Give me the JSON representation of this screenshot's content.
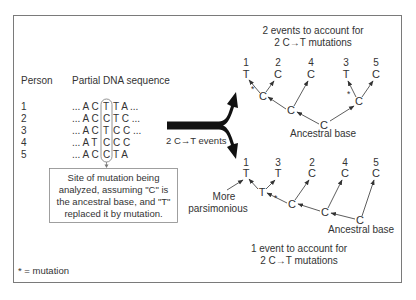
{
  "left_panel": {
    "header_person": "Person",
    "header_sequence": "Partial DNA sequence",
    "rows": [
      {
        "person": "1",
        "prefix": "... A C",
        "site": "T",
        "suffix": "T A ..."
      },
      {
        "person": "2",
        "prefix": "... A C",
        "site": "C",
        "suffix": "T C ..."
      },
      {
        "person": "3",
        "prefix": "... A C",
        "site": "T",
        "suffix": "C C ..."
      },
      {
        "person": "4",
        "prefix": "... A T",
        "site": "C",
        "suffix": "C C"
      },
      {
        "person": "5",
        "prefix": "... A C",
        "site": "C",
        "suffix": "T A"
      }
    ],
    "callout": {
      "line1": "Site of mutation being",
      "line2": "analyzed, assuming \"C\" is",
      "line3": "the ancestral base, and \"T\"",
      "line4": "replaced it by mutation."
    },
    "footnote": "* = mutation"
  },
  "split_arrow": {
    "label": "2 C→T events"
  },
  "top_tree": {
    "title_line1": "2 events to account for",
    "title_line2": "2 C→T mutations",
    "leaves": [
      {
        "num": "1",
        "base": "T"
      },
      {
        "num": "2",
        "base": "C"
      },
      {
        "num": "4",
        "base": "C"
      },
      {
        "num": "3",
        "base": "T"
      },
      {
        "num": "5",
        "base": "C"
      }
    ],
    "internal": [
      "C",
      "C",
      "C",
      "C"
    ],
    "mutation_mark": "*",
    "root_label": "Ancestral base"
  },
  "bottom_tree": {
    "leaves": [
      {
        "num": "1",
        "base": "T"
      },
      {
        "num": "3",
        "base": "T"
      },
      {
        "num": "2",
        "base": "C"
      },
      {
        "num": "4",
        "base": "C"
      },
      {
        "num": "5",
        "base": "C"
      }
    ],
    "internal": [
      "T",
      "C",
      "C",
      "C"
    ],
    "mutation_mark": "*",
    "side_label_line1": "More",
    "side_label_line2": "parsimonious",
    "root_label": "Ancestral base",
    "caption_line1": "1 event to account for",
    "caption_line2": "2 C→T mutations"
  }
}
